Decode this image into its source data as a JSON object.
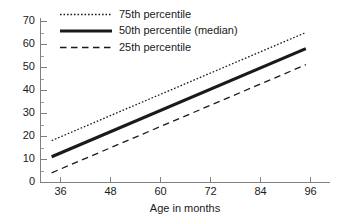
{
  "chart_data": {
    "type": "line",
    "title": "",
    "subtitle": "",
    "xlabel": "Age in months",
    "ylabel": "",
    "xlim": [
      32,
      98
    ],
    "ylim": [
      0,
      73
    ],
    "xticks": [
      36,
      48,
      60,
      72,
      84,
      96
    ],
    "xticklabels": [
      "36",
      "48",
      "60",
      "72",
      "84",
      "96"
    ],
    "yticks": [
      0,
      10,
      20,
      30,
      40,
      50,
      60,
      70
    ],
    "yticklabels": [
      "0",
      "10",
      "20",
      "30",
      "40",
      "50",
      "60",
      "70"
    ],
    "y_minor_ticks": [
      5,
      15,
      25,
      35,
      45,
      55,
      65
    ],
    "grid": false,
    "legend_position": "upper left inside",
    "x": [
      34,
      95
    ],
    "series": [
      {
        "name": "75th percentile",
        "style": "dotted",
        "color": "#1a1a1a",
        "values": [
          18,
          65
        ]
      },
      {
        "name": "50th percentile (median)",
        "style": "solid-thick",
        "color": "#1a1a1a",
        "values": [
          11,
          58
        ]
      },
      {
        "name": "25th percentile",
        "style": "dashed",
        "color": "#1a1a1a",
        "values": [
          4,
          51
        ]
      }
    ]
  },
  "axes": {
    "x_title": "Age in months",
    "y_title": "",
    "x_tick_0": "36",
    "x_tick_1": "48",
    "x_tick_2": "60",
    "x_tick_3": "72",
    "x_tick_4": "84",
    "x_tick_5": "96",
    "y_tick_0": "0",
    "y_tick_1": "10",
    "y_tick_2": "20",
    "y_tick_3": "30",
    "y_tick_4": "40",
    "y_tick_5": "50",
    "y_tick_6": "60",
    "y_tick_7": "70"
  },
  "legend": {
    "items": [
      {
        "label": "75th percentile",
        "sample": "dotted-line-sample"
      },
      {
        "label": "50th percentile (median)",
        "sample": "solid-thick-line-sample"
      },
      {
        "label": "25th percentile",
        "sample": "dashed-line-sample"
      }
    ]
  }
}
